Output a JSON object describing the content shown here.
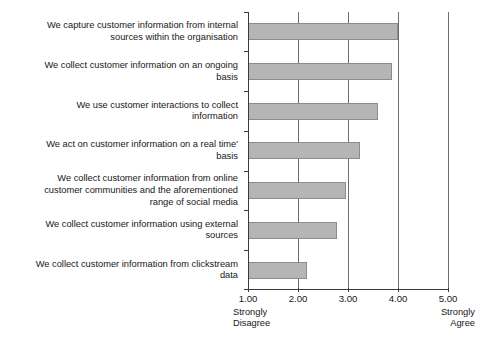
{
  "chart_data": {
    "type": "bar",
    "orientation": "horizontal",
    "title": "",
    "xlabel": "",
    "ylabel": "",
    "xlim": [
      1.0,
      5.0
    ],
    "grid": true,
    "gridlines": [
      2.0,
      3.0,
      4.0,
      5.0
    ],
    "legend": "none",
    "categories": [
      "We capture customer information from internal\nsources within the organisation",
      "We collect customer information on an ongoing\nbasis",
      "We use customer interactions to collect\ninformation",
      "We act on customer information on a real time'\nbasis",
      "We collect customer information from online\ncustomer communities and the aforementioned\nrange of social media",
      "We collect customer information using external\nsources",
      "We collect customer information from clickstream\ndata"
    ],
    "values": [
      4.0,
      3.88,
      3.6,
      3.24,
      2.96,
      2.78,
      2.18
    ],
    "tick_values": [
      1.0,
      2.0,
      3.0,
      4.0,
      5.0
    ],
    "tick_labels": [
      "1.00",
      "2.00",
      "3.00",
      "4.00",
      "5.00"
    ],
    "scale_anchor_low": "Strongly\nDisagree",
    "scale_anchor_high": "Strongly\nAgree",
    "bar_color": "#b5b5b5",
    "bar_border_color": "#8c8c8c",
    "axis_color": "#3a3a3a",
    "gridline_color": "#6e6e6e"
  }
}
